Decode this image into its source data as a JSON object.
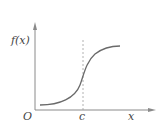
{
  "diagram": {
    "type": "function-graph",
    "labels": {
      "y_axis": "f(x)",
      "x_axis": "x",
      "origin": "O",
      "marker": "c"
    },
    "colors": {
      "axis": "#8a8a8a",
      "curve": "#6a6a6a",
      "dashed": "#a0a0a0",
      "text": "#444444"
    }
  }
}
